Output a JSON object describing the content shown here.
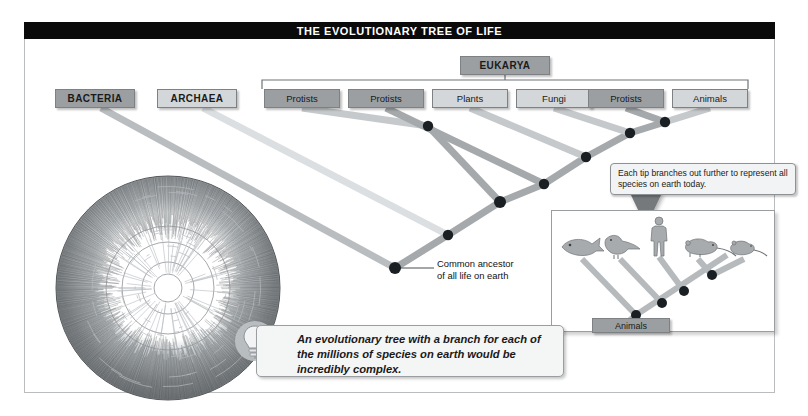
{
  "figure": {
    "title": "THE EVOLUTIONARY TREE OF LIFE",
    "title_bg": "#0a0a0a",
    "title_color": "#ffffff",
    "frame_border": "#b9bdc0"
  },
  "domains": [
    {
      "label": "BACTERIA",
      "tone": "dark",
      "x": 55,
      "y": 89,
      "w": 80,
      "h": 19
    },
    {
      "label": "ARCHAEA",
      "tone": "light",
      "x": 157,
      "y": 89,
      "w": 80,
      "h": 19
    }
  ],
  "eukarya": {
    "label": "EUKARYA",
    "tone": "dark",
    "x": 460,
    "y": 56,
    "w": 90,
    "h": 19,
    "bracket": {
      "left": 262,
      "right": 748,
      "y": 80,
      "stem_x": 505,
      "color": "#6f7477"
    }
  },
  "kingdoms": [
    {
      "label": "Protists",
      "tone": "dark",
      "x": 264,
      "y": 89,
      "w": 76,
      "h": 19
    },
    {
      "label": "Protists",
      "tone": "dark",
      "x": 348,
      "y": 89,
      "w": 76,
      "h": 19
    },
    {
      "label": "Plants",
      "tone": "light",
      "x": 432,
      "y": 89,
      "w": 76,
      "h": 19
    },
    {
      "label": "Fungi",
      "tone": "light",
      "x": 516,
      "y": 89,
      "w": 76,
      "h": 19
    },
    {
      "label": "Protists",
      "tone": "dark",
      "x": 588,
      "y": 89,
      "w": 76,
      "h": 19
    },
    {
      "label": "Animals",
      "tone": "light",
      "x": 672,
      "y": 89,
      "w": 76,
      "h": 19
    }
  ],
  "annotations": {
    "common_ancestor": "Common ancestor\nof all life on earth",
    "common_ancestor_line1": "Common ancestor",
    "common_ancestor_line2": "of all life on earth"
  },
  "callout": {
    "text": "Each tip branches out further to represent all species on earth today.",
    "bg": "#f2f3f4",
    "border": "#8d9194"
  },
  "inset": {
    "label": "Animals",
    "organisms": [
      "fish",
      "bird",
      "human",
      "rat",
      "mouse"
    ],
    "border": "#9a9ea1"
  },
  "tip": {
    "text": "An evolutionary tree with a branch for each of the millions of species on earth would be incredibly complex.",
    "icon": "lightbulb-icon",
    "bg": "#f4f5f5"
  },
  "circular_tree": {
    "name": "circular-phylogram",
    "cx": 168,
    "cy": 288,
    "r": 112,
    "ring_color": "#6d7174",
    "inner_color": "#ffffff"
  },
  "palette": {
    "branch_dark": "#9b9fa2",
    "branch_light": "#d8dbdd",
    "node": "#1a1f24",
    "box_dark": "#9b9fa2",
    "box_light": "#d4d7d9",
    "box_border": "#7d8184"
  },
  "chart_data": {
    "type": "diagram",
    "title": "THE EVOLUTIONARY TREE OF LIFE",
    "tips": [
      "BACTERIA",
      "ARCHAEA",
      "Protists",
      "Protists",
      "Plants",
      "Fungi",
      "Protists",
      "Animals"
    ],
    "internal_nodes": [
      {
        "name": "common-ancestor-of-all-life",
        "x": 395,
        "y": 268
      },
      {
        "name": "node-archaea-eukarya",
        "x": 448,
        "y": 235
      },
      {
        "name": "node-eukarya-root",
        "x": 500,
        "y": 202
      },
      {
        "name": "node-protist2-clade",
        "x": 544,
        "y": 184
      },
      {
        "name": "node-plants-clade",
        "x": 586,
        "y": 157
      },
      {
        "name": "node-fungi-clade",
        "x": 630,
        "y": 133
      },
      {
        "name": "node-protist3-animals",
        "x": 665,
        "y": 122
      },
      {
        "name": "node-protist1",
        "x": 428,
        "y": 126
      }
    ],
    "legend": [],
    "notes": [
      "Common ancestor of all life on earth",
      "Each tip branches out further to represent all species on earth today.",
      "An evolutionary tree with a branch for each of the millions of species on earth would be incredibly complex."
    ]
  }
}
